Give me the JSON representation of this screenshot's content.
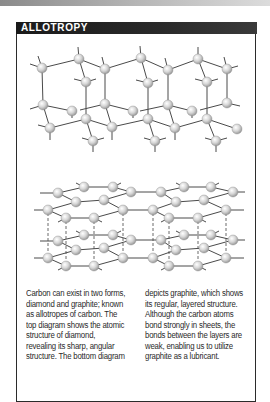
{
  "header": {
    "title": "ALLOTROPY"
  },
  "figures": {
    "top": {
      "subject": "diamond",
      "label": "diamond-structure-diagram"
    },
    "bottom": {
      "subject": "graphite",
      "label": "graphite-structure-diagram"
    }
  },
  "body": {
    "left_lines": [
      "Carbon can exist in two forms,",
      "diamond and graphite; known",
      "as allotropes of carbon. The",
      "top diagram shows the atomic",
      "structure of diamond,",
      "revealing its sharp, angular",
      "structure. The bottom diagram"
    ],
    "right_lines": [
      "depicts graphite, which shows",
      "its regular, layered structure.",
      "Although the carbon atoms",
      "bond strongly in sheets, the",
      "bonds between the layers are",
      "weak, enabling us to utilize",
      "graphite as a lubricant."
    ]
  },
  "colors": {
    "title_bar": "#1f1f1f",
    "atom_fill": "#d8d8d8",
    "bond": "#444444",
    "text": "#2a2a2a"
  }
}
